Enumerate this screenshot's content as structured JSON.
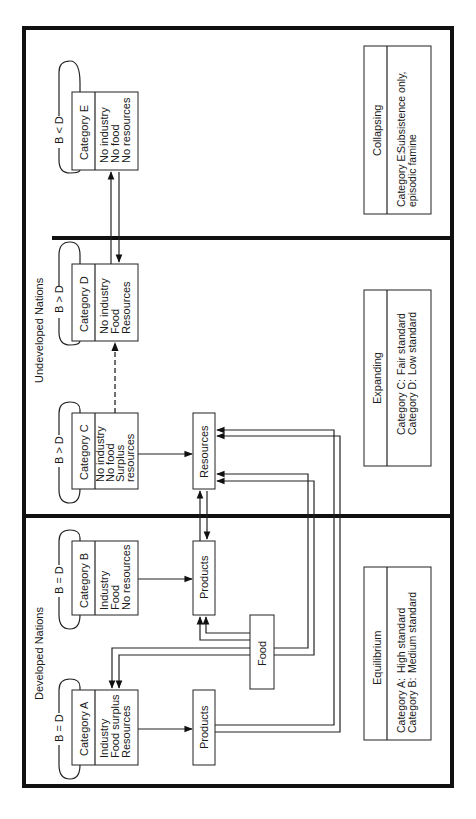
{
  "groups": {
    "developed": "Developed Nations",
    "undeveloped": "Undeveloped Nations"
  },
  "categories": [
    {
      "id": "A",
      "title": "Category A",
      "balance": "B = D",
      "lines": [
        "Industry",
        "Food surplus",
        "Resources"
      ]
    },
    {
      "id": "B",
      "title": "Category B",
      "balance": "B = D",
      "lines": [
        "Industry",
        "Food",
        "No resources"
      ]
    },
    {
      "id": "C",
      "title": "Category C",
      "balance": "B > D",
      "lines": [
        "No industry",
        "No food",
        "Surplus",
        "resources"
      ]
    },
    {
      "id": "D",
      "title": "Category D",
      "balance": "B > D",
      "lines": [
        "No industry",
        "Food",
        "Resources"
      ]
    },
    {
      "id": "E",
      "title": "Category E",
      "balance": "B < D",
      "lines": [
        "No industry",
        "No food",
        "No resources"
      ]
    }
  ],
  "flow_nodes": {
    "products_a": "Products",
    "products_b": "Products",
    "resources": "Resources",
    "food": "Food"
  },
  "legends": {
    "equilibrium": {
      "title": "Equilibrium",
      "rows": [
        [
          "Category A:",
          "High standard"
        ],
        [
          "Category B:",
          "Medium standard"
        ]
      ]
    },
    "expanding": {
      "title": "Expanding",
      "rows": [
        [
          "Category C:",
          "Fair standard"
        ],
        [
          "Category D:",
          "Low standard"
        ]
      ]
    },
    "collapsing": {
      "title": "Collapsing",
      "rows": [
        [
          "Category E:",
          "Subsistence only,"
        ],
        [
          "",
          "episodic famine"
        ]
      ]
    }
  }
}
